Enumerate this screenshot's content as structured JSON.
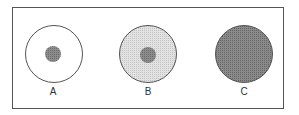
{
  "figure": {
    "panels": [
      {
        "label": "A",
        "outer_fill": "#ffffff",
        "inner_dot": true
      },
      {
        "label": "B",
        "outer_fill": "#d4d4d4",
        "inner_dot": true
      },
      {
        "label": "C",
        "outer_fill": "#7a7a7a",
        "inner_dot": false
      }
    ],
    "colors": {
      "outline": "#555555",
      "dot": "#7f7f7f",
      "light_fill": "#d4d4d4",
      "dark_fill": "#7a7a7a"
    }
  }
}
